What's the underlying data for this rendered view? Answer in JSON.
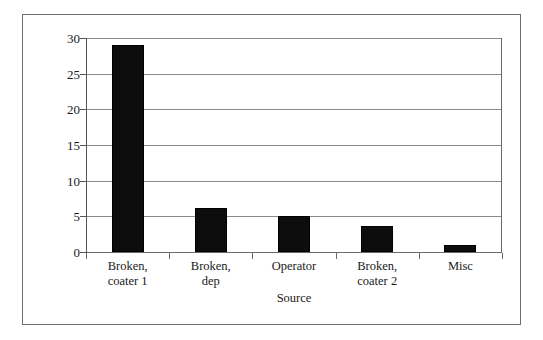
{
  "chart_data": {
    "type": "bar",
    "title": "",
    "subtitle": "",
    "xlabel": "Source",
    "ylabel": "",
    "categories": [
      "Broken, coater 1",
      "Broken, dep",
      "Operator",
      "Broken, coater 2",
      "Misc"
    ],
    "category_lines": [
      [
        "Broken,",
        "coater 1"
      ],
      [
        "Broken,",
        "dep"
      ],
      [
        "Operator",
        ""
      ],
      [
        "Broken,",
        "coater 2"
      ],
      [
        "Misc",
        ""
      ]
    ],
    "values": [
      29,
      6.1,
      5,
      3.7,
      1
    ],
    "ylim": [
      0,
      30
    ],
    "ytick_values": [
      0,
      5,
      10,
      15,
      20,
      25,
      30
    ],
    "ytick_labels": [
      "0",
      "5",
      "10",
      "15",
      "20",
      "25",
      "30"
    ],
    "grid": true,
    "grid_axis": "y",
    "legend": false,
    "legend_position": "none",
    "bar_color": "#0d0d0d",
    "gridline_color": "#8a8a8a",
    "axis_color": "#555555",
    "frame_color": "#6e6e6e",
    "background_color": "#ffffff",
    "text_color": "#1a1a1a"
  }
}
